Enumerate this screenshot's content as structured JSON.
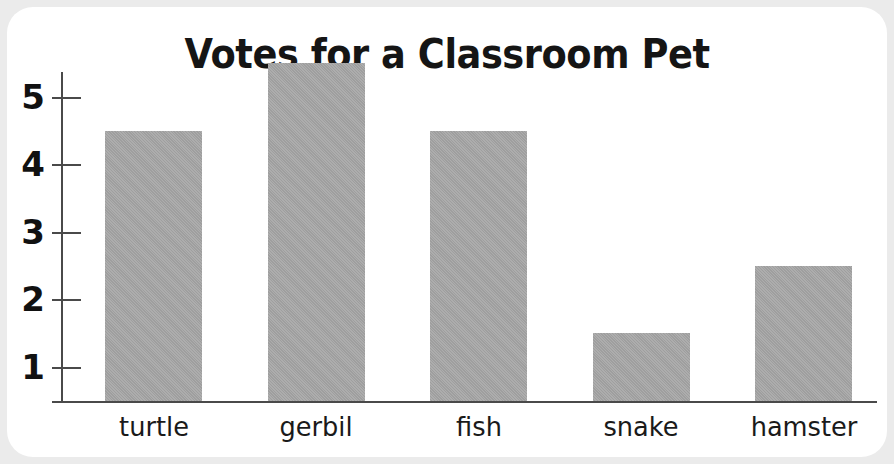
{
  "card": {
    "background_color": "#ffffff",
    "page_background_color": "#ebebeb"
  },
  "chart_data": {
    "type": "bar",
    "title": "Votes for a Classroom Pet",
    "xlabel": "",
    "ylabel": "",
    "categories": [
      "turtle",
      "gerbil",
      "fish",
      "snake",
      "hamster"
    ],
    "values": [
      4,
      5,
      4,
      1,
      2
    ],
    "ytick_labels": [
      "1",
      "2",
      "3",
      "4",
      "5"
    ],
    "ytick_values": [
      1,
      2,
      3,
      4,
      5
    ],
    "ylim": [
      0,
      5.4
    ],
    "grid": false,
    "legend": null,
    "bar_color": "#a7a7a7",
    "axis_color": "#4a4a4a",
    "text_color": "#111111"
  }
}
